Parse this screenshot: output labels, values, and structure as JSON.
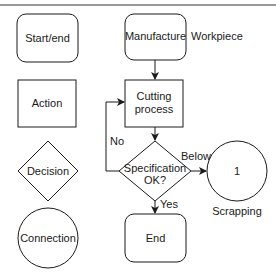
{
  "legend": {
    "start_end": "Start/end",
    "action": "Action",
    "decision": "Decision",
    "connection": "Connection"
  },
  "flow": {
    "start": "Manufacture",
    "start_note": "Workpiece",
    "process_line1": "Cutting",
    "process_line2": "process",
    "decision_line1": "Specification",
    "decision_line2": "OK?",
    "connector": "1",
    "connector_note": "Scrapping",
    "end": "End",
    "edge_no": "No",
    "edge_below": "Below",
    "edge_yes": "Yes"
  },
  "colors": {
    "stroke": "#1a1a1a",
    "background": "#ffffff"
  }
}
